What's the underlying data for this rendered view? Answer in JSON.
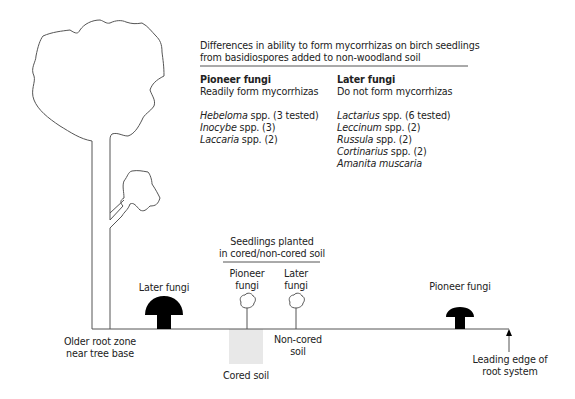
{
  "header": {
    "line1": "Differences in ability to form mycorrhizas on birch seedlings",
    "line2": "from basidiospores added to non-woodland soil"
  },
  "pioneer_column": {
    "title": "Pioneer fungi",
    "subtitle": "Readily form mycorrhizas",
    "items": [
      {
        "genus": "Hebeloma",
        "rest": " spp. (3 tested)"
      },
      {
        "genus": "Inocybe",
        "rest": " spp. (3)"
      },
      {
        "genus": "Laccaria",
        "rest": " spp. (2)"
      }
    ]
  },
  "later_column": {
    "title": "Later fungi",
    "subtitle": "Do not form mycorrhizas",
    "items": [
      {
        "genus": "Lactarius",
        "rest": " spp. (6 tested)"
      },
      {
        "genus": "Leccinum",
        "rest": " spp. (2)"
      },
      {
        "genus": "Russula",
        "rest": " spp. (2)"
      },
      {
        "genus": "Cortinarius",
        "rest": " spp. (2)"
      },
      {
        "genus": "Amanita muscaria",
        "rest": ""
      }
    ]
  },
  "diagram": {
    "seedlings_label_1": "Seedlings planted",
    "seedlings_label_2": "in cored/non-cored soil",
    "seedling_pioneer_1": "Pioneer",
    "seedling_pioneer_2": "fungi",
    "seedling_later_1": "Later",
    "seedling_later_2": "fungi",
    "later_fungi_label": "Later fungi",
    "pioneer_fungi_label": "Pioneer fungi",
    "older_root_1": "Older root zone",
    "older_root_2": "near tree base",
    "non_cored_1": "Non-cored",
    "non_cored_2": "soil",
    "cored_soil": "Cored soil",
    "leading_edge_1": "Leading edge of",
    "leading_edge_2": "root system"
  },
  "colors": {
    "line": "#555555",
    "mushroom": "#000000",
    "cored_soil": "#e8e8e8"
  }
}
